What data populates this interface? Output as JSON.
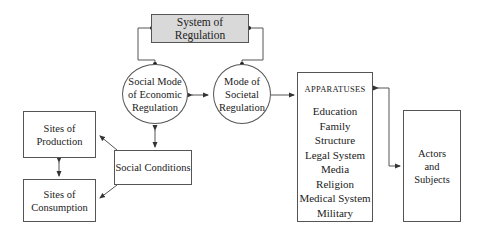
{
  "diagram": {
    "system_of_regulation": "System of Regulation",
    "social_mode": [
      "Social Mode",
      "of Economic",
      "Regulation"
    ],
    "societal_mode": [
      "Mode of",
      "Societal",
      "Regulation"
    ],
    "sites_production": [
      "Sites of",
      "Production"
    ],
    "sites_consumption": [
      "Sites of",
      "Consumption"
    ],
    "social_conditions": "Social Conditions",
    "apparatuses": {
      "title": "APPARATUSES",
      "items": [
        "Education",
        "Family Structure",
        "Legal System",
        "Media",
        "Religion",
        "Medical System",
        "Military"
      ]
    },
    "actors": [
      "Actors",
      "and",
      "Subjects"
    ]
  },
  "colors": {
    "highlight_box": "#d9d9d9",
    "line": "#555555"
  }
}
